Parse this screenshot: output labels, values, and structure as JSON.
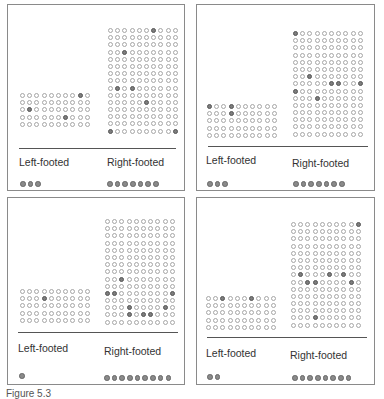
{
  "figure": {
    "caption": "Figure 5.3",
    "grid_columns": 10,
    "left_rows": 5,
    "right_rows": 15,
    "colors": {
      "empty_ring": "#a6a6a6",
      "hit_fill": "#7d7d7d",
      "border": "#8a8a8a"
    }
  },
  "panels": [
    {
      "left_label": "Left-footed",
      "right_label": "Right-footed",
      "left_hits": [
        [
          0,
          8
        ],
        [
          2,
          1
        ],
        [
          3,
          6
        ]
      ],
      "right_hits": [
        [
          0,
          6
        ],
        [
          3,
          2
        ],
        [
          8,
          1
        ],
        [
          8,
          3
        ],
        [
          10,
          5
        ],
        [
          14,
          0
        ],
        [
          14,
          9
        ]
      ],
      "left_count": 3,
      "right_count": 7
    },
    {
      "left_label": "Left-footed",
      "right_label": "Right-footed",
      "left_hits": [
        [
          0,
          0
        ],
        [
          0,
          3
        ],
        [
          1,
          3
        ]
      ],
      "right_hits": [
        [
          0,
          0
        ],
        [
          6,
          2
        ],
        [
          7,
          5
        ],
        [
          7,
          6
        ],
        [
          7,
          9
        ],
        [
          8,
          0
        ],
        [
          9,
          3
        ]
      ],
      "left_count": 3,
      "right_count": 7
    },
    {
      "left_label": "Left-footed",
      "right_label": "Right-footed",
      "left_hits": [
        [
          1,
          3
        ]
      ],
      "right_hits": [
        [
          8,
          2
        ],
        [
          10,
          0
        ],
        [
          10,
          1
        ],
        [
          10,
          9
        ],
        [
          12,
          3
        ],
        [
          12,
          8
        ],
        [
          13,
          3
        ],
        [
          13,
          5
        ],
        [
          13,
          6
        ]
      ],
      "left_count": 1,
      "right_count": 9
    },
    {
      "left_label": "Left-footed",
      "right_label": "Right-footed",
      "left_hits": [
        [
          0,
          2
        ],
        [
          0,
          6
        ]
      ],
      "right_hits": [
        [
          0,
          9
        ],
        [
          7,
          1
        ],
        [
          7,
          5
        ],
        [
          7,
          7
        ],
        [
          8,
          2
        ],
        [
          8,
          3
        ],
        [
          8,
          8
        ],
        [
          13,
          3
        ]
      ],
      "left_count": 2,
      "right_count": 8
    }
  ]
}
